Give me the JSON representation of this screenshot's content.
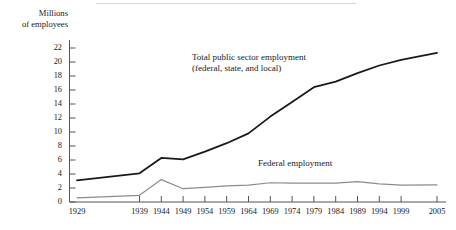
{
  "figure": {
    "y_axis_title": "Millions\nof employees",
    "annotations": [
      {
        "name": "total-series-annotation",
        "text": "Total public sector employment\n(federal, state, and local)"
      },
      {
        "name": "federal-series-annotation",
        "text": "Federal employment"
      }
    ]
  },
  "chart_data": {
    "type": "line",
    "title": "",
    "xlabel": "",
    "ylabel": "Millions of employees",
    "ylim": [
      0,
      23
    ],
    "xtick_labels": [
      "1929",
      "1939",
      "1944",
      "1949",
      "1954",
      "1959",
      "1964",
      "1969",
      "1974",
      "1979",
      "1984",
      "1989",
      "1994",
      "1999",
      "2005"
    ],
    "ytick_labels": [
      "0",
      "2",
      "4",
      "6",
      "8",
      "10",
      "12",
      "14",
      "16",
      "18",
      "20",
      "22"
    ],
    "ytick_values": [
      0,
      2,
      4,
      6,
      8,
      10,
      12,
      14,
      16,
      18,
      20,
      22
    ],
    "x": [
      1929,
      1939,
      1944,
      1949,
      1954,
      1959,
      1964,
      1969,
      1974,
      1979,
      1984,
      1989,
      1994,
      1999,
      2005
    ],
    "grid": false,
    "legend_position": "inline-annotation",
    "series": [
      {
        "name": "Total public sector employment (federal, state, and local)",
        "color": "#1a1a1a",
        "width": 1.8,
        "values": [
          3.1,
          4.1,
          6.3,
          6.1,
          7.2,
          8.4,
          9.8,
          12.2,
          14.3,
          16.4,
          17.2,
          18.4,
          19.5,
          20.3,
          21.3
        ]
      },
      {
        "name": "Federal employment",
        "color": "#8c8c8c",
        "width": 1.2,
        "values": [
          0.6,
          0.95,
          3.2,
          1.9,
          2.1,
          2.3,
          2.4,
          2.75,
          2.7,
          2.7,
          2.7,
          2.9,
          2.6,
          2.4,
          2.45
        ]
      }
    ]
  }
}
